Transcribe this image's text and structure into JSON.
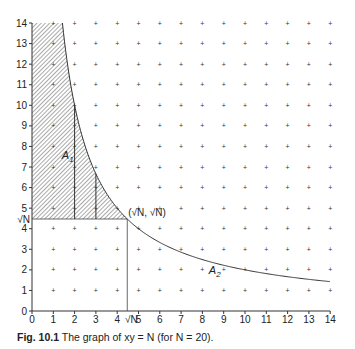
{
  "caption": {
    "label": "Fig. 10.1",
    "text": "The graph of xy = N (for N = 20)."
  },
  "chart_data": {
    "type": "line",
    "title": "The graph of xy = N (for N = 20)",
    "function": "y = N / x",
    "N": 20,
    "xlim": [
      0,
      14
    ],
    "ylim": [
      0,
      14
    ],
    "x_ticks": [
      "0",
      "1",
      "2",
      "3",
      "4",
      "5",
      "6",
      "7",
      "8",
      "9",
      "10",
      "11",
      "12",
      "13",
      "14"
    ],
    "y_ticks": [
      "0",
      "1",
      "2",
      "3",
      "4",
      "5",
      "6",
      "7",
      "8",
      "9",
      "10",
      "11",
      "12",
      "13",
      "14"
    ],
    "special_tick_labels": {
      "x": "√N",
      "y": "√N"
    },
    "point_label": "(√N, √N)",
    "region_labels": [
      "A1",
      "A2"
    ],
    "grid": "dots",
    "series": [
      {
        "name": "xy=N",
        "x": [
          1.43,
          2,
          3,
          4,
          4.47,
          5,
          6,
          7,
          8,
          9,
          10,
          11,
          12,
          13,
          14
        ],
        "y": [
          14,
          10,
          6.67,
          5,
          4.47,
          4,
          3.33,
          2.86,
          2.5,
          2.22,
          2,
          1.82,
          1.67,
          1.54,
          1.43
        ]
      }
    ]
  }
}
